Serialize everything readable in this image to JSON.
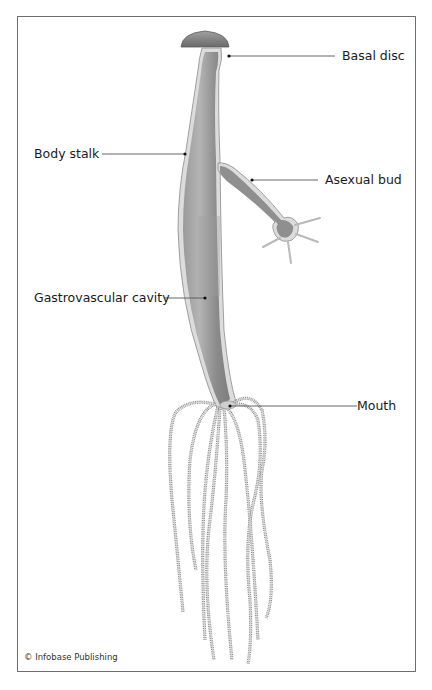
{
  "diagram": {
    "labels": {
      "basal_disc": "Basal disc",
      "body_stalk": "Body stalk",
      "asexual_bud": "Asexual bud",
      "gastrovascular_cavity": "Gastrovascular cavity",
      "mouth": "Mouth"
    },
    "credit": "© Infobase Publishing"
  },
  "colors": {
    "body_fill": "#8c8c8c",
    "body_outline": "#d4d4d4",
    "disc_fill": "#7a7a7a",
    "leader_line": "#555555",
    "frame": "#6e6e6e"
  }
}
